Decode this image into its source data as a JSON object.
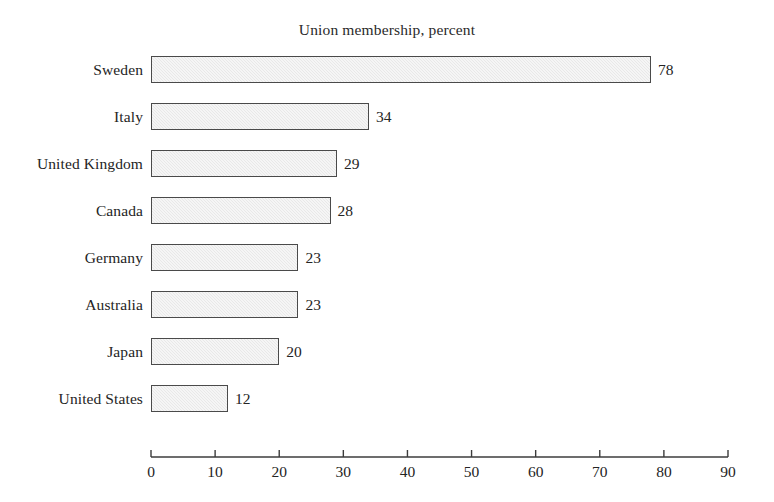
{
  "chart_data": {
    "type": "bar",
    "orientation": "horizontal",
    "title": "Union membership, percent",
    "xlabel": "",
    "ylabel": "",
    "categories": [
      "Sweden",
      "Italy",
      "United Kingdom",
      "Canada",
      "Germany",
      "Australia",
      "Japan",
      "United States"
    ],
    "values": [
      78,
      34,
      29,
      28,
      23,
      23,
      20,
      12
    ],
    "value_labels": [
      "78",
      "34",
      "29",
      "28",
      "23",
      "23",
      "20",
      "12"
    ],
    "xlim": [
      0,
      90
    ],
    "xticks": [
      0,
      10,
      20,
      30,
      40,
      50,
      60,
      70,
      80,
      90
    ],
    "xtick_labels": [
      "0",
      "10",
      "20",
      "30",
      "40",
      "50",
      "60",
      "70",
      "80",
      "90"
    ],
    "grid": false,
    "legend": null,
    "colors": {
      "bar_fill": "#ebebeb",
      "bar_border": "#4a4a4a",
      "axis": "#3c3c3c",
      "text": "#242424",
      "background": "#ffffff"
    }
  }
}
